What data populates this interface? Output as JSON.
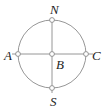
{
  "figure": {
    "type": "geometry-circle-diagram",
    "background_color": "#ffffff",
    "width": 108,
    "height": 110
  },
  "style": {
    "stroke_color": "#8a8a8a",
    "stroke_width": 0.9,
    "label_color": "#1d1d1d",
    "marker_fill": "#ffffff",
    "marker_stroke": "#8a8a8a",
    "marker_radius": 2.4,
    "label_font_size": 13
  },
  "circle": {
    "center_x": 52,
    "center_y": 54,
    "radius": 34,
    "fill": "none"
  },
  "points": [
    {
      "id": "N",
      "label": "N",
      "x": 52,
      "y": 20,
      "label_x": 50,
      "label_y": 14,
      "role": "top-vertex"
    },
    {
      "id": "A",
      "label": "A",
      "x": 18,
      "y": 54,
      "label_x": 4,
      "label_y": 60,
      "role": "left-vertex"
    },
    {
      "id": "B",
      "label": "B",
      "x": 52,
      "y": 54,
      "label_x": 56,
      "label_y": 69,
      "role": "center"
    },
    {
      "id": "C",
      "label": "C",
      "x": 86,
      "y": 54,
      "label_x": 92,
      "label_y": 60,
      "role": "right-vertex"
    },
    {
      "id": "S",
      "label": "S",
      "x": 52,
      "y": 88,
      "label_x": 50,
      "label_y": 106,
      "role": "bottom-vertex"
    }
  ],
  "segments": [
    {
      "id": "AC",
      "name": "horizontal-diameter",
      "x1": 12,
      "y1": 54,
      "x2": 93,
      "y2": 54
    },
    {
      "id": "NS",
      "name": "vertical-diameter",
      "x1": 52,
      "y1": 20,
      "x2": 52,
      "y2": 93
    }
  ]
}
